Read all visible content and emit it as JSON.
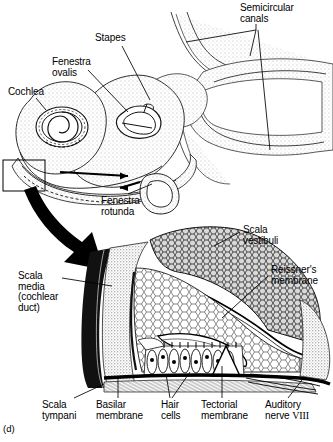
{
  "figure": {
    "panel_id": "(d)"
  },
  "upper_diagram": {
    "name": "inner ear gross anatomy",
    "labels": [
      {
        "id": "semicircular-canals",
        "text": "Semicircular\ncanals",
        "x": 240,
        "y": 3,
        "align": "left"
      },
      {
        "id": "stapes",
        "text": "Stapes",
        "x": 95,
        "y": 33,
        "align": "left"
      },
      {
        "id": "fenestra-ovalis",
        "text": "Fenestra\novalis",
        "x": 52,
        "y": 57,
        "align": "left"
      },
      {
        "id": "cochlea",
        "text": "Cochlea",
        "x": 8,
        "y": 87,
        "align": "left"
      },
      {
        "id": "fenestra-rotunda",
        "text": "Fenestra\nrotunda",
        "x": 101,
        "y": 196,
        "align": "left"
      }
    ]
  },
  "lower_diagram": {
    "name": "cochlear duct cross-section (organ of Corti)",
    "labels": [
      {
        "id": "scala-vestibuli",
        "text": "Scala\nvestibuli",
        "x": 243,
        "y": 225,
        "align": "left"
      },
      {
        "id": "reissners-membrane",
        "text": "Reissner's\nmembrane",
        "x": 271,
        "y": 265,
        "align": "left"
      },
      {
        "id": "scala-media",
        "text": "Scala\nmedia\n(cochlear\nduct)",
        "x": 18,
        "y": 271,
        "align": "left"
      },
      {
        "id": "scala-tympani",
        "text": "Scala\ntympani",
        "x": 42,
        "y": 400,
        "align": "left"
      },
      {
        "id": "basilar-membrane",
        "text": "Basilar\nmembrane",
        "x": 96,
        "y": 400,
        "align": "left"
      },
      {
        "id": "hair-cells",
        "text": "Hair\ncells",
        "x": 161,
        "y": 400,
        "align": "left"
      },
      {
        "id": "tectorial-membrane",
        "text": "Tectorial\nmembrane",
        "x": 201,
        "y": 400,
        "align": "left"
      },
      {
        "id": "auditory-nerve",
        "text": "Auditory",
        "x": 265,
        "y": 400,
        "align": "left"
      },
      {
        "id": "auditory-nerve-line2",
        "text": "nerve ",
        "x": 265,
        "y": 411,
        "align": "left"
      }
    ],
    "nerve_numeral": "VIII"
  },
  "colors": {
    "ink": "#000000",
    "paper": "#ffffff",
    "stipple": "#8a8a8a",
    "midtone": "#4a4a4a"
  }
}
